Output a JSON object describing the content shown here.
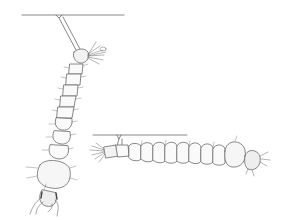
{
  "figure": {
    "colors": {
      "background": "#ffffff",
      "ink": "#6a6a6a",
      "shade": "#d8d8d8"
    },
    "larvae": [
      {
        "id": "larva-vertical",
        "orientation": "hanging-diagonal",
        "siphon": "long",
        "segments": 9
      },
      {
        "id": "larva-horizontal",
        "orientation": "parallel-to-surface",
        "siphon": "short",
        "segments": 9
      }
    ]
  }
}
